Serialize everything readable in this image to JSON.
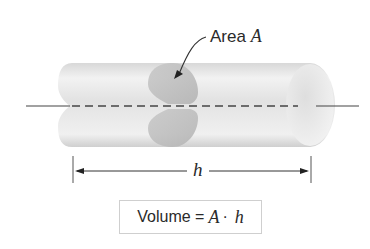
{
  "diagram": {
    "labels": {
      "area_text": "Area",
      "area_symbol": "A",
      "length_symbol": "h",
      "formula_lhs": "Volume =",
      "formula_a": "A",
      "formula_dot": "·",
      "formula_h": "h"
    },
    "colors": {
      "cylinder_light": "#f4f4f4",
      "cylinder_mid": "#dcdcdc",
      "cylinder_dark": "#c8c8c8",
      "cross_section": "#bdbdbd",
      "axis_line": "#444444",
      "text": "#2a2a2a",
      "box_border": "#cfcfcf"
    },
    "nodes": [
      {
        "id": "cylinder",
        "type": "3d-cylinder"
      },
      {
        "id": "cross-section",
        "type": "disk",
        "label": "Area A"
      },
      {
        "id": "axis",
        "type": "dashed-centerline"
      },
      {
        "id": "length-dimension",
        "type": "dimension-arrow",
        "label": "h"
      },
      {
        "id": "formula",
        "type": "boxed-equation",
        "label": "Volume = A · h"
      }
    ]
  }
}
